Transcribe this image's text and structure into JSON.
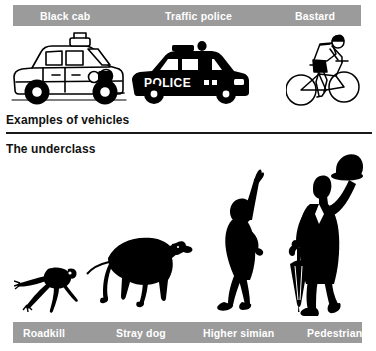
{
  "page": {
    "background_color": "#ffffff",
    "bar_color": "#9b9b9b",
    "bar_text_color": "#ffffff",
    "ink_color": "#000000"
  },
  "top_bar": {
    "labels": [
      {
        "text": "Black cab",
        "left_px": 27
      },
      {
        "text": "Traffic police",
        "left_px": 152
      },
      {
        "text": "Bastard",
        "left_px": 282
      }
    ]
  },
  "headings": {
    "vehicles": "Examples of vehicles",
    "underclass": "The underclass"
  },
  "bottom_bar": {
    "labels": [
      {
        "text": "Roadkill",
        "left_px": 10
      },
      {
        "text": "Stray dog",
        "left_px": 103
      },
      {
        "text": "Higher simian",
        "left_px": 190
      },
      {
        "text": "Pedestrian",
        "left_px": 294
      }
    ]
  },
  "artwork": {
    "vehicles": [
      {
        "name": "black-cab-illustration",
        "caption": "Black cab"
      },
      {
        "name": "police-car-illustration",
        "caption": "Traffic police"
      },
      {
        "name": "cyclist-illustration",
        "caption": "Bastard"
      }
    ],
    "underclass": [
      {
        "name": "roadkill-frog-silhouette",
        "caption": "Roadkill"
      },
      {
        "name": "stray-dog-silhouette",
        "caption": "Stray dog"
      },
      {
        "name": "higher-simian-silhouette",
        "caption": "Higher simian"
      },
      {
        "name": "pedestrian-silhouette",
        "caption": "Pedestrian"
      }
    ]
  }
}
